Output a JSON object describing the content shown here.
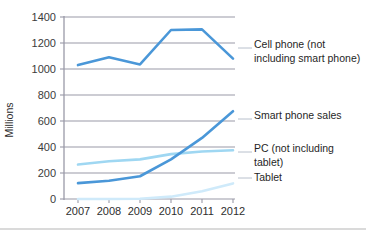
{
  "chart_data": {
    "type": "line",
    "title": "",
    "xlabel": "",
    "ylabel": "Millions",
    "x": [
      2007,
      2008,
      2009,
      2010,
      2011,
      2012
    ],
    "categories": [
      "2007",
      "2008",
      "2009",
      "2010",
      "2011",
      "2012"
    ],
    "ylim": [
      0,
      1400
    ],
    "yticks": [
      0,
      200,
      400,
      600,
      800,
      1000,
      1200,
      1400
    ],
    "ytick_labels": [
      "0",
      "200",
      "400",
      "600",
      "800",
      "1000",
      "1200",
      "1400"
    ],
    "grid": "horizontal",
    "legend_position": "right-inline-labels",
    "series": [
      {
        "name": "Cell phone (not including smart phone)",
        "label_line1": "Cell phone (not",
        "label_line2": "including smart phone)",
        "color": "#4a97d8",
        "width": 2.6,
        "values": [
          1030,
          1090,
          1035,
          1300,
          1305,
          1080
        ]
      },
      {
        "name": "Smart phone sales",
        "label_line1": "Smart phone sales",
        "label_line2": "",
        "color": "#4a97d8",
        "width": 2.6,
        "values": [
          122,
          140,
          175,
          305,
          470,
          675
        ]
      },
      {
        "name": "PC (not including tablet)",
        "label_line1": "PC (not including",
        "label_line2": "tablet)",
        "color": "#9fd7f2",
        "width": 2.6,
        "values": [
          265,
          290,
          305,
          345,
          365,
          375
        ]
      },
      {
        "name": "Tablet",
        "label_line1": "Tablet",
        "label_line2": "",
        "color": "#cfeafa",
        "width": 2.6,
        "values": [
          0,
          0,
          2,
          18,
          60,
          120
        ]
      }
    ]
  },
  "axis": {
    "y_title": "Millions",
    "y_ticks": [
      "1400",
      "1200",
      "1000",
      "800",
      "600",
      "400",
      "200",
      "0"
    ],
    "x_ticks": [
      "2007",
      "2008",
      "2009",
      "2010",
      "2011",
      "2012"
    ]
  },
  "labels": {
    "cell_phone_l1": "Cell phone (not",
    "cell_phone_l2": "including smart phone)",
    "smart_phone_l1": "Smart phone sales",
    "pc_l1": "PC (not including",
    "pc_l2": "tablet)",
    "tablet_l1": "Tablet"
  },
  "colors": {
    "series_dark_blue": "#4a97d8",
    "series_light_blue": "#9fd7f2",
    "series_pale_blue": "#cfeafa",
    "gridline": "#9a9aa8",
    "text": "#2e2e2e"
  }
}
